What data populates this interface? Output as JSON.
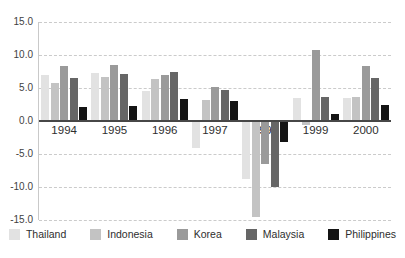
{
  "chart_data": {
    "type": "bar",
    "title": "",
    "xlabel": "",
    "ylabel": "",
    "categories": [
      "1994",
      "1995",
      "1996",
      "1997",
      "1998",
      "1999",
      "2000"
    ],
    "series": [
      {
        "name": "Thailand",
        "color": "#e2e2e2",
        "values": [
          7.0,
          7.2,
          4.5,
          -3.9,
          -8.6,
          3.5,
          3.5
        ]
      },
      {
        "name": "Indonesia",
        "color": "#c3c3c3",
        "values": [
          5.8,
          6.6,
          6.4,
          3.2,
          -14.4,
          -0.5,
          3.6
        ]
      },
      {
        "name": "Korea",
        "color": "#9a9a9a",
        "values": [
          8.3,
          8.5,
          6.9,
          5.1,
          -6.4,
          10.7,
          8.3
        ]
      },
      {
        "name": "Malaysia",
        "color": "#666666",
        "values": [
          6.5,
          7.1,
          7.4,
          4.7,
          -9.8,
          3.7,
          6.5
        ]
      },
      {
        "name": "Philippines",
        "color": "#141414",
        "values": [
          2.1,
          2.3,
          3.4,
          3.0,
          -3.1,
          1.1,
          2.4
        ]
      }
    ],
    "ylim": [
      -15,
      15
    ],
    "yticks": [
      15,
      10,
      5,
      0,
      -5,
      -10,
      -15
    ],
    "ytick_labels": [
      "15.0",
      "10.0",
      "5.0",
      "0.0",
      "-5.0",
      "-10.0",
      "-15.0"
    ],
    "grid": "horizontal-dashed",
    "legend_position": "bottom"
  },
  "colors": {
    "gridline": "#cbcbcb",
    "zero_axis": "#474747",
    "axis_line": "#c9c9c9",
    "tick_text": "#3f3f3f",
    "label_text": "#2e2e2e",
    "background": "#ffffff"
  }
}
